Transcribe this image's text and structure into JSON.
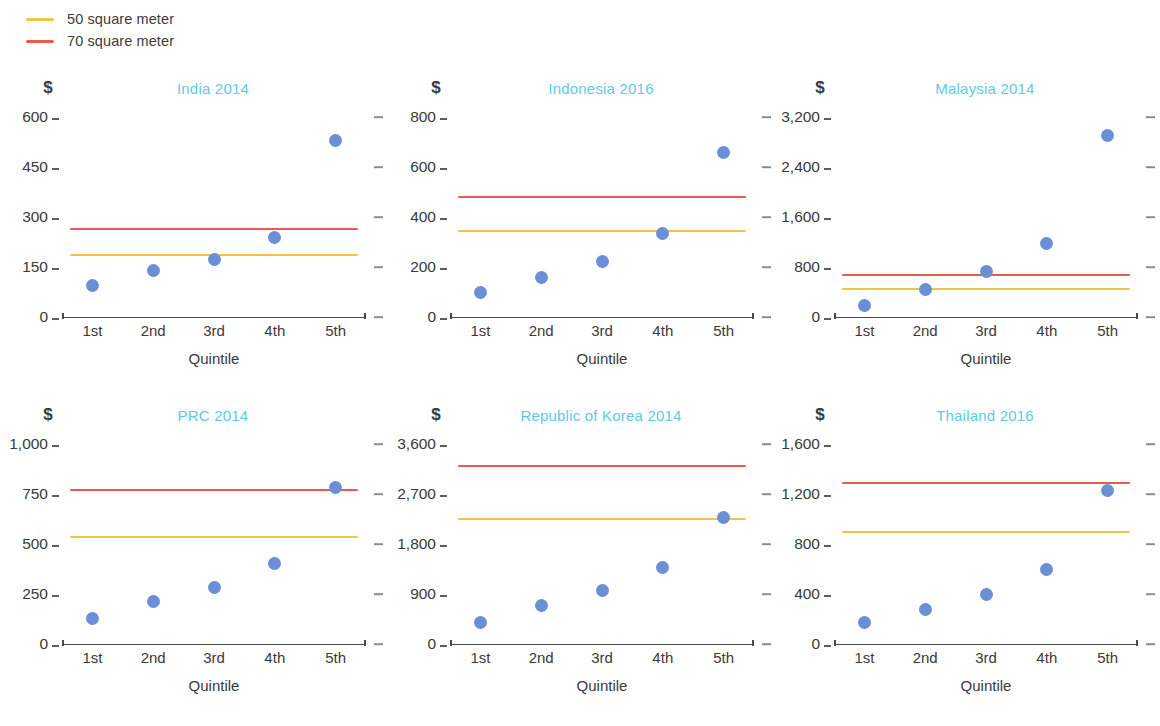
{
  "legend": {
    "items": [
      {
        "label": "50 square meter",
        "color": "#f5c243",
        "name": "legend-item-50sqm"
      },
      {
        "label": "70 square meter",
        "color": "#ea5a4e",
        "name": "legend-item-70sqm"
      }
    ]
  },
  "axis": {
    "currency_symbol": "$",
    "x_title": "Quintile",
    "x_categories": [
      "1st",
      "2nd",
      "3rd",
      "4th",
      "5th"
    ]
  },
  "colors": {
    "dot": "#6b8fd6",
    "line_50": "#f5c243",
    "line_70": "#ea5a4e",
    "title": "#61c9e8",
    "axis": "#4a4a47"
  },
  "chart_data": [
    {
      "type": "scatter",
      "title": "India 2014",
      "xlabel": "Quintile",
      "ylabel": "$",
      "categories": [
        "1st",
        "2nd",
        "3rd",
        "4th",
        "5th"
      ],
      "yticks": [
        0,
        150,
        300,
        450,
        600
      ],
      "yticklabels": [
        "0",
        "150",
        "300",
        "450",
        "600"
      ],
      "ylim": [
        0,
        600
      ],
      "series": [
        {
          "name": "Affordable price by quintile",
          "values": [
            95,
            140,
            172,
            240,
            530
          ]
        }
      ],
      "reference_lines": [
        {
          "name": "50 square meter",
          "value": 185,
          "color": "#f5c243"
        },
        {
          "name": "70 square meter",
          "value": 265,
          "color": "#ea5a4e"
        }
      ]
    },
    {
      "type": "scatter",
      "title": "Indonesia 2016",
      "xlabel": "Quintile",
      "ylabel": "$",
      "categories": [
        "1st",
        "2nd",
        "3rd",
        "4th",
        "5th"
      ],
      "yticks": [
        0,
        200,
        400,
        600,
        800
      ],
      "yticklabels": [
        "0",
        "200",
        "400",
        "600",
        "800"
      ],
      "ylim": [
        0,
        800
      ],
      "series": [
        {
          "name": "Affordable price by quintile",
          "values": [
            100,
            160,
            222,
            335,
            660
          ]
        }
      ],
      "reference_lines": [
        {
          "name": "50 square meter",
          "value": 345,
          "color": "#f5c243"
        },
        {
          "name": "70 square meter",
          "value": 482,
          "color": "#ea5a4e"
        }
      ]
    },
    {
      "type": "scatter",
      "title": "Malaysia 2014",
      "xlabel": "Quintile",
      "ylabel": "$",
      "categories": [
        "1st",
        "2nd",
        "3rd",
        "4th",
        "5th"
      ],
      "yticks": [
        0,
        800,
        1600,
        2400,
        3200
      ],
      "yticklabels": [
        "0",
        "800",
        "1,600",
        "2,400",
        "3,200"
      ],
      "ylim": [
        0,
        3200
      ],
      "series": [
        {
          "name": "Affordable price by quintile",
          "values": [
            190,
            440,
            730,
            1180,
            2900
          ]
        }
      ],
      "reference_lines": [
        {
          "name": "50 square meter",
          "value": 450,
          "color": "#f5c243"
        },
        {
          "name": "70 square meter",
          "value": 670,
          "color": "#ea5a4e"
        }
      ]
    },
    {
      "type": "scatter",
      "title": "PRC 2014",
      "xlabel": "Quintile",
      "ylabel": "$",
      "categories": [
        "1st",
        "2nd",
        "3rd",
        "4th",
        "5th"
      ],
      "yticks": [
        0,
        250,
        500,
        750,
        1000
      ],
      "yticklabels": [
        "0",
        "250",
        "500",
        "750",
        "1,000"
      ],
      "ylim": [
        0,
        1000
      ],
      "series": [
        {
          "name": "Affordable price by quintile",
          "values": [
            130,
            215,
            285,
            405,
            785
          ]
        }
      ],
      "reference_lines": [
        {
          "name": "50 square meter",
          "value": 535,
          "color": "#f5c243"
        },
        {
          "name": "70 square meter",
          "value": 772,
          "color": "#ea5a4e"
        }
      ]
    },
    {
      "type": "scatter",
      "title": "Republic of Korea 2014",
      "xlabel": "Quintile",
      "ylabel": "$",
      "categories": [
        "1st",
        "2nd",
        "3rd",
        "4th",
        "5th"
      ],
      "yticks": [
        0,
        900,
        1800,
        2700,
        3600
      ],
      "yticklabels": [
        "0",
        "900",
        "1,800",
        "2,700",
        "3,600"
      ],
      "ylim": [
        0,
        3600
      ],
      "series": [
        {
          "name": "Affordable price by quintile",
          "values": [
            390,
            700,
            955,
            1370,
            2270
          ]
        }
      ],
      "reference_lines": [
        {
          "name": "50 square meter",
          "value": 2250,
          "color": "#f5c243"
        },
        {
          "name": "70 square meter",
          "value": 3200,
          "color": "#ea5a4e"
        }
      ]
    },
    {
      "type": "scatter",
      "title": "Thailand 2016",
      "xlabel": "Quintile",
      "ylabel": "$",
      "categories": [
        "1st",
        "2nd",
        "3rd",
        "4th",
        "5th"
      ],
      "yticks": [
        0,
        400,
        800,
        1200,
        1600
      ],
      "yticklabels": [
        "0",
        "400",
        "800",
        "1,200",
        "1,600"
      ],
      "ylim": [
        0,
        1600
      ],
      "series": [
        {
          "name": "Affordable price by quintile",
          "values": [
            175,
            275,
            400,
            600,
            1230
          ]
        }
      ],
      "reference_lines": [
        {
          "name": "50 square meter",
          "value": 900,
          "color": "#f5c243"
        },
        {
          "name": "70 square meter",
          "value": 1285,
          "color": "#ea5a4e"
        }
      ]
    }
  ]
}
